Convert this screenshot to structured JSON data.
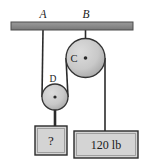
{
  "figure": {
    "type": "pulley-system-diagram",
    "title": "",
    "ceiling": {
      "name": "support-beam",
      "x": 11,
      "y": 22,
      "width": 122,
      "height": 8,
      "fill": "#8c8c8c",
      "stroke": "#555555"
    },
    "anchors": [
      {
        "id": "A",
        "label": "A",
        "x": 43,
        "label_x": 43,
        "label_y": 18,
        "italic": true
      },
      {
        "id": "B",
        "label": "B",
        "x": 85.5,
        "label_x": 86,
        "label_y": 18,
        "italic": true
      }
    ],
    "pulleys": [
      {
        "id": "C",
        "label": "C",
        "cx": 85.5,
        "cy": 58,
        "r": 19.5,
        "label_x": 74,
        "label_y": 62,
        "fill": "#c9c9c9",
        "stroke": "#333333",
        "hub_r": 1.8,
        "type": "fixed"
      },
      {
        "id": "D",
        "label": "D",
        "cx": 55,
        "cy": 97,
        "r": 13,
        "label_x": 53,
        "label_y": 82,
        "fill": "#c9c9c9",
        "stroke": "#333333",
        "hub_r": 1.6,
        "type": "movable"
      }
    ],
    "ropes": [
      {
        "name": "rope-A-to-D-left",
        "x1": 43,
        "y1": 30,
        "x2": 42,
        "y2": 97,
        "width": 1.6
      },
      {
        "name": "rope-B-to-C-hub",
        "x1": 85.5,
        "y1": 30,
        "x2": 85.5,
        "y2": 58,
        "width": 1.6
      },
      {
        "name": "rope-D-right-to-C-left",
        "x1": 68,
        "y1": 97,
        "x2": 66,
        "y2": 58,
        "width": 1.6
      },
      {
        "name": "rope-C-right-to-load",
        "x1": 105,
        "y1": 58,
        "x2": 105,
        "y2": 131,
        "width": 1.6
      },
      {
        "name": "hanger-D-to-unknown-block",
        "x1": 55,
        "y1": 97,
        "x2": 55,
        "y2": 126,
        "width": 2.6
      }
    ],
    "blocks": [
      {
        "id": "unknown-block",
        "label": "?",
        "x": 35,
        "y": 126,
        "width": 32,
        "height": 29,
        "label_x": 51,
        "label_y": 145,
        "font_size": 13,
        "fill": "#d4d4d4",
        "stroke": "#2b2b2b",
        "inner_stroke": "#9a9a9a"
      },
      {
        "id": "known-load-block",
        "label": "120 lb",
        "x": 74,
        "y": 131,
        "width": 64,
        "height": 27,
        "label_x": 106,
        "label_y": 149,
        "font_size": 12,
        "fill": "#d4d4d4",
        "stroke": "#2b2b2b",
        "inner_stroke": "#9a9a9a"
      }
    ],
    "colors": {
      "background": "#ffffff",
      "line": "#2b2b2b",
      "beam_fill": "#8c8c8c",
      "pulley_fill": "#c9c9c9",
      "block_fill": "#d4d4d4",
      "text": "#1a1a1a"
    }
  }
}
